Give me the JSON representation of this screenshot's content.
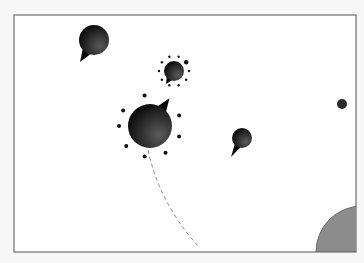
{
  "scene": {
    "width": 364,
    "height": 263,
    "background": "#f7f7f7",
    "frame": {
      "x": 14,
      "y": 15,
      "w": 342,
      "h": 237,
      "fill": "#ffffff",
      "stroke": "#6e6e6e"
    }
  },
  "colors": {
    "ball_dark": "#0a0a0a",
    "ball_light": "#5a5a5a",
    "dot": "#111111",
    "planet": "#8c8c8c",
    "planet_edge": "#555555",
    "trajectory": "#888888"
  },
  "player": {
    "cx": 150,
    "cy": 126,
    "r": 22,
    "nozzle_angle_deg": -55,
    "orbit_dots": 8,
    "orbit_r": 31
  },
  "trajectory": {
    "path": "M148 150 Q160 205 200 248"
  },
  "bubbles": [
    {
      "id": "bubble-1",
      "cx": 94,
      "cy": 40,
      "r": 15,
      "tail_tip": [
        80,
        62
      ],
      "ring": false
    },
    {
      "id": "bubble-2",
      "cx": 174,
      "cy": 71,
      "r": 10,
      "tail_tip": [
        166,
        84
      ],
      "ring": true,
      "ring_r": 15,
      "ring_dots": 10
    },
    {
      "id": "bubble-3",
      "cx": 242,
      "cy": 138,
      "r": 10,
      "tail_tip": [
        231,
        157
      ],
      "ring": false
    }
  ],
  "pellet": {
    "cx": 342,
    "cy": 104,
    "r": 5
  },
  "planet": {
    "cx": 362,
    "cy": 252,
    "r": 46
  }
}
